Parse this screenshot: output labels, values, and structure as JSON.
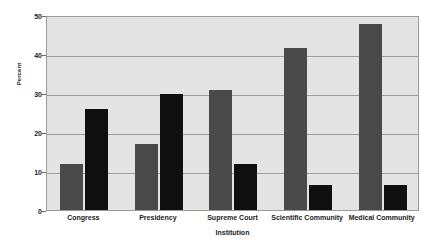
{
  "chart_data": {
    "type": "bar",
    "title": "",
    "subtitle": "",
    "xlabel": "Institution",
    "ylabel": "Percent",
    "categories": [
      "Congress",
      "Presidency",
      "Supreme Court",
      "Scientific Community",
      "Medical Community"
    ],
    "series": [
      {
        "name": "series-1",
        "color": "#4a4a4a",
        "values": [
          11.8,
          17.0,
          30.9,
          41.6,
          47.6
        ]
      },
      {
        "name": "series-2",
        "color": "#100f0f",
        "values": [
          25.9,
          29.8,
          11.7,
          6.4,
          6.4
        ]
      }
    ],
    "ylim": [
      0,
      50
    ],
    "yticks": [
      0,
      10,
      20,
      30,
      40,
      50
    ],
    "ytick_labels": [
      "0",
      "10",
      "20",
      "30",
      "40",
      "50"
    ],
    "grid": true,
    "grid_axis": "y",
    "legend": false,
    "legend_position": "none",
    "plot_background": "#e4e4e4",
    "figure_background": "#ffffff",
    "grid_color": "#9d9d9d",
    "axis_color": "#6a6a6a",
    "text_color": "#1b1b1b",
    "annotations": []
  }
}
